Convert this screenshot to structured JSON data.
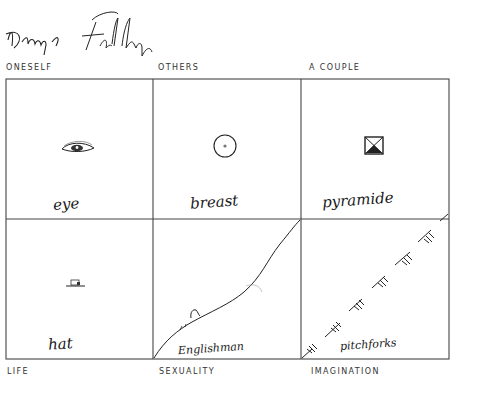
{
  "signature": {
    "text": "Dany Fally",
    "description": "handwritten signature"
  },
  "header_labels": [
    "ONESELF",
    "OTHERS",
    "A COUPLE"
  ],
  "footer_labels": [
    "LIFE",
    "SEXUALITY",
    "IMAGINATION"
  ],
  "cells": [
    {
      "row": 0,
      "col": 0,
      "category": "ONESELF",
      "symbol": "eye-icon",
      "caption": "eye"
    },
    {
      "row": 0,
      "col": 1,
      "category": "OTHERS",
      "symbol": "breast-icon",
      "caption": "breast"
    },
    {
      "row": 0,
      "col": 2,
      "category": "A COUPLE",
      "symbol": "pyramid-icon",
      "caption": "pyramide"
    },
    {
      "row": 1,
      "col": 0,
      "category": "LIFE",
      "symbol": "hat-icon",
      "caption": "hat"
    },
    {
      "row": 1,
      "col": 1,
      "category": "SEXUALITY",
      "symbol": "englishman-curve",
      "caption": "Englishman"
    },
    {
      "row": 1,
      "col": 2,
      "category": "IMAGINATION",
      "symbol": "pitchforks-line",
      "caption": "pitchforks"
    }
  ],
  "colors": {
    "ink": "#1a1a1a",
    "grid": "#444444",
    "background": "#ffffff"
  }
}
